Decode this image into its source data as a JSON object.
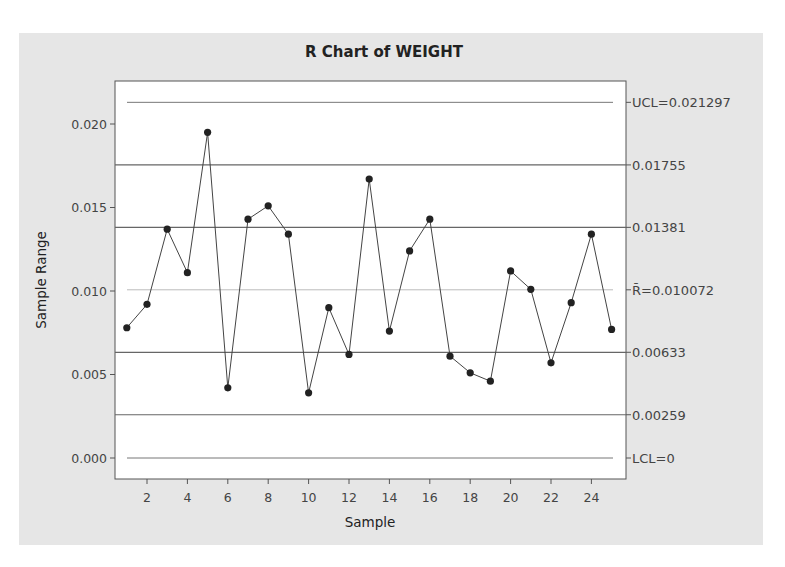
{
  "chart_data": {
    "type": "line",
    "title": "R Chart of WEIGHT",
    "xlabel": "Sample",
    "ylabel": "Sample Range",
    "x": [
      1,
      2,
      3,
      4,
      5,
      6,
      7,
      8,
      9,
      10,
      11,
      12,
      13,
      14,
      15,
      16,
      17,
      18,
      19,
      20,
      21,
      22,
      23,
      24,
      25
    ],
    "series": [
      {
        "name": "Sample Range",
        "values": [
          0.0078,
          0.0092,
          0.0137,
          0.0111,
          0.0195,
          0.0042,
          0.0143,
          0.0151,
          0.0134,
          0.0039,
          0.009,
          0.0062,
          0.0167,
          0.0076,
          0.0124,
          0.0143,
          0.0061,
          0.0051,
          0.0046,
          0.0112,
          0.0101,
          0.0057,
          0.0093,
          0.0134,
          0.0077
        ]
      }
    ],
    "xticks": [
      "2",
      "4",
      "6",
      "8",
      "10",
      "12",
      "14",
      "16",
      "18",
      "20",
      "22",
      "24"
    ],
    "xtick_values": [
      2,
      4,
      6,
      8,
      10,
      12,
      14,
      16,
      18,
      20,
      22,
      24
    ],
    "yticks": [
      "0.000",
      "0.005",
      "0.010",
      "0.015",
      "0.020"
    ],
    "ytick_values": [
      0.0,
      0.005,
      0.01,
      0.015,
      0.02
    ],
    "xlim": [
      0.4,
      25.6
    ],
    "ylim": [
      -0.00125,
      0.02265
    ],
    "control_lines": [
      {
        "label": "UCL=0.021297",
        "value": 0.021297,
        "style": "ucl"
      },
      {
        "label": "0.01755",
        "value": 0.01755,
        "style": "zone"
      },
      {
        "label": "0.01381",
        "value": 0.01381,
        "style": "zone"
      },
      {
        "label": "R̄=0.010072",
        "value": 0.010072,
        "style": "center"
      },
      {
        "label": "0.00633",
        "value": 0.00633,
        "style": "zone"
      },
      {
        "label": "0.00259",
        "value": 0.00259,
        "style": "zone"
      },
      {
        "label": "LCL=0",
        "value": 0.0,
        "style": "lcl"
      }
    ],
    "grid": false,
    "legend": "none"
  },
  "colors": {
    "panel_bg": "#e6e6e6",
    "plot_bg": "#ffffff",
    "frame": "#555555",
    "zone_line": "#666666",
    "limit_line": "#777777",
    "center_line": "#bbbbbb",
    "data_line": "#444444",
    "marker": "#222222"
  }
}
